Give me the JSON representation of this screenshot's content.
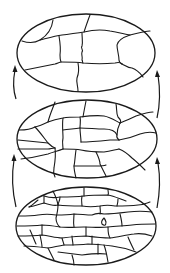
{
  "diagram": {
    "type": "hierarchical-segmentation-pyramid",
    "stroke_color": "#1a1a1a",
    "background": "#ffffff",
    "levels": [
      {
        "name": "top",
        "description": "coarsest partition",
        "center": [
          86,
          53
        ],
        "rx": 69,
        "ry": 39
      },
      {
        "name": "middle",
        "description": "intermediate partition",
        "center": [
          87,
          139
        ],
        "rx": 70,
        "ry": 39
      },
      {
        "name": "bottom",
        "description": "finest partition",
        "center": [
          86,
          226
        ],
        "rx": 70,
        "ry": 39
      }
    ],
    "arrows": [
      {
        "side": "left",
        "from": "middle",
        "to": "top",
        "direction": "up"
      },
      {
        "side": "right",
        "from": "middle",
        "to": "top",
        "direction": "up"
      },
      {
        "side": "left",
        "from": "bottom",
        "to": "middle",
        "direction": "up"
      },
      {
        "side": "right",
        "from": "bottom",
        "to": "middle",
        "direction": "up"
      }
    ]
  }
}
